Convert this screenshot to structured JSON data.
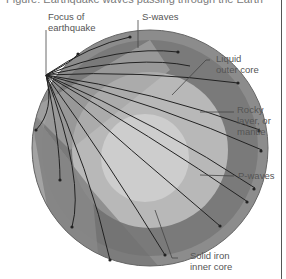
{
  "title": "Figure: Earthquake waves passing through the Earth",
  "labels": {
    "focus": [
      "Focus of",
      "earthquake"
    ],
    "s_waves": "S-waves",
    "outer_core": [
      "Liquid",
      "outer core"
    ],
    "mantle": [
      "Rocky",
      "layer, or",
      "mantle"
    ],
    "p_waves": "P-waves",
    "inner_core": [
      "Solid iron",
      "inner core"
    ]
  },
  "colors": {
    "crust": "#8a8a8a",
    "mantle": "#7c7c7c",
    "outer_core": "#b9b9b9",
    "inner_core": "#cfcfcf",
    "shadow_zone": "#9d9d9d",
    "wave": "#222222"
  }
}
